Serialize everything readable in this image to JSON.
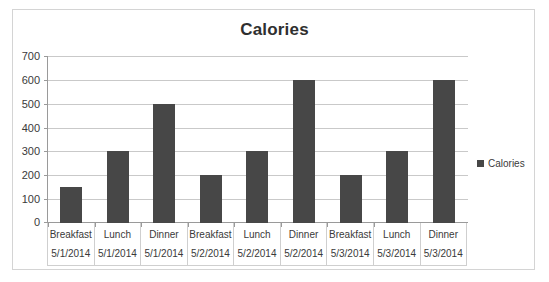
{
  "chart_data": {
    "type": "bar",
    "title": "Calories",
    "xlabel": "",
    "ylabel": "",
    "ylim": [
      0,
      700
    ],
    "yticks": [
      0,
      100,
      200,
      300,
      400,
      500,
      600,
      700
    ],
    "grid": true,
    "legend_position": "right",
    "legend": [
      "Calories"
    ],
    "categories": [
      "Breakfast 5/1/2014",
      "Lunch 5/1/2014",
      "Dinner 5/1/2014",
      "Breakfast 5/2/2014",
      "Lunch 5/2/2014",
      "Dinner 5/2/2014",
      "Breakfast 5/3/2014",
      "Lunch 5/3/2014",
      "Dinner 5/3/2014"
    ],
    "category_parts": [
      {
        "meal": "Breakfast",
        "date": "5/1/2014"
      },
      {
        "meal": "Lunch",
        "date": "5/1/2014"
      },
      {
        "meal": "Dinner",
        "date": "5/1/2014"
      },
      {
        "meal": "Breakfast",
        "date": "5/2/2014"
      },
      {
        "meal": "Lunch",
        "date": "5/2/2014"
      },
      {
        "meal": "Dinner",
        "date": "5/2/2014"
      },
      {
        "meal": "Breakfast",
        "date": "5/3/2014"
      },
      {
        "meal": "Lunch",
        "date": "5/3/2014"
      },
      {
        "meal": "Dinner",
        "date": "5/3/2014"
      }
    ],
    "series": [
      {
        "name": "Calories",
        "color": "#474747",
        "values": [
          150,
          300,
          500,
          200,
          300,
          600,
          200,
          300,
          600
        ]
      }
    ]
  },
  "colors": {
    "bar": "#474747",
    "gridline": "#c9c9c9",
    "axis": "#9a9a9a",
    "frame": "#d4d4d4",
    "text": "#3a3a3a",
    "title": "#2f2f2f"
  }
}
